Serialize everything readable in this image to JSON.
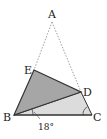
{
  "diagram": {
    "points": {
      "A": {
        "label": "A",
        "x": 52,
        "y": 19
      },
      "E": {
        "label": "E",
        "x": 34,
        "y": 70
      },
      "D": {
        "label": "D",
        "x": 81,
        "y": 92
      },
      "B": {
        "label": "B",
        "x": 14,
        "y": 115
      },
      "C": {
        "label": "C",
        "x": 92,
        "y": 115
      }
    },
    "angle_label": "18°",
    "colors": {
      "dark_fill": "#a6a6a6",
      "light_fill": "#dcdcdc",
      "stroke": "#333333",
      "dotted": "#888888"
    }
  }
}
